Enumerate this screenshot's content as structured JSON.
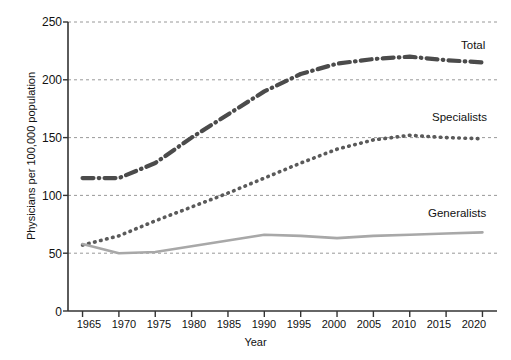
{
  "chart_data": {
    "type": "line",
    "title": "",
    "xlabel": "Year",
    "ylabel": "Physicians per 100,000 population",
    "xlim": [
      1963,
      2022
    ],
    "ylim": [
      0,
      250
    ],
    "yticks": [
      0,
      50,
      100,
      150,
      200,
      250
    ],
    "xticks": [
      1965,
      1970,
      1975,
      1980,
      1985,
      1990,
      1995,
      2000,
      2005,
      2010,
      2015,
      2020
    ],
    "grid": "horizontal-dashed",
    "legend_position": "inline-right",
    "x": [
      1965,
      1970,
      1975,
      1980,
      1985,
      1990,
      1995,
      2000,
      2005,
      2010,
      2015,
      2020
    ],
    "series": [
      {
        "name": "Total",
        "style": "dash-dot",
        "color": "#4b4b4b",
        "values": [
          115,
          115,
          128,
          150,
          170,
          190,
          205,
          214,
          218,
          220,
          217,
          215
        ]
      },
      {
        "name": "Specialists",
        "style": "dotted",
        "color": "#5a5a5a",
        "values": [
          57,
          65,
          78,
          90,
          102,
          115,
          128,
          140,
          148,
          152,
          150,
          149
        ]
      },
      {
        "name": "Generalists",
        "style": "solid",
        "color": "#a8a8a8",
        "values": [
          58,
          50,
          51,
          56,
          61,
          66,
          65,
          63,
          65,
          66,
          67,
          68
        ]
      }
    ]
  },
  "axes": {
    "ytick_labels": [
      "0",
      "50",
      "100",
      "150",
      "200",
      "250"
    ],
    "xtick_labels": [
      "1965",
      "1970",
      "1975",
      "1980",
      "1985",
      "1990",
      "1995",
      "2000",
      "2005",
      "2010",
      "2015",
      "2020"
    ],
    "ylabel": "Physicians per 100,000 population",
    "xlabel": "Year"
  },
  "labels": {
    "total": "Total",
    "specialists": "Specialists",
    "generalists": "Generalists"
  },
  "colors": {
    "total": "#4b4b4b",
    "specialists": "#5a5a5a",
    "generalists": "#a8a8a8",
    "axis": "#333333",
    "grid": "#8d8d8d",
    "background": "#ffffff"
  }
}
